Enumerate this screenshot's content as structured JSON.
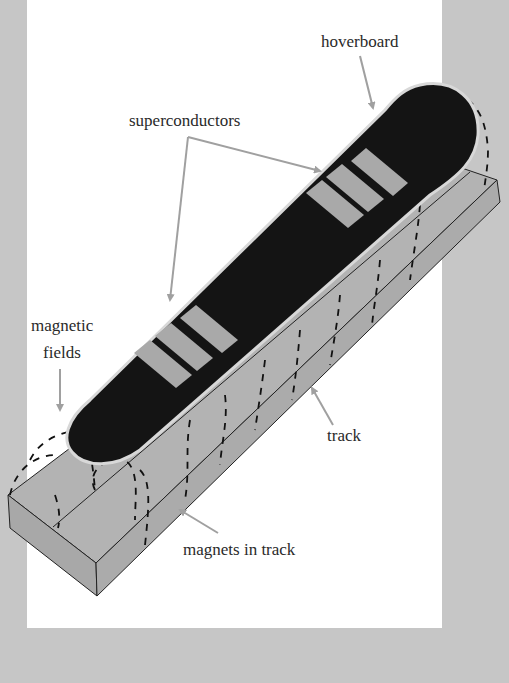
{
  "figure": {
    "colors": {
      "background": "#c6c6c6",
      "panel": "#ffffff",
      "board": "#111111",
      "superconductor": "#a9a9a9",
      "track": "#b3b3b3",
      "arrow": "#a0a0a0"
    }
  },
  "labels": {
    "hoverboard": "hoverboard",
    "superconductors": "superconductors",
    "magnetic_fields_line1": "magnetic",
    "magnetic_fields_line2": "fields",
    "track": "track",
    "magnets": "magnets in track"
  }
}
